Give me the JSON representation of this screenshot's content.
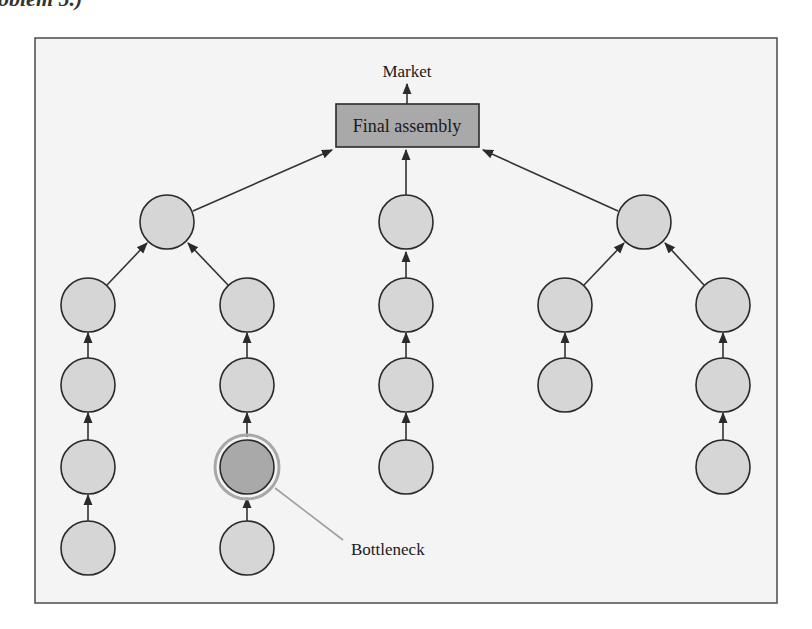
{
  "caption_fragment": "oblem 5.)",
  "diagram": {
    "title_top": "Market",
    "final_assembly_label": "Final assembly",
    "bottleneck_label": "Bottleneck",
    "colors": {
      "frame_fill": "#f4f4f4",
      "node_fill": "#d6d6d6",
      "bottleneck_fill": "#a9a9a9",
      "box_fill": "#a9a9a9",
      "stroke": "#2a2a2a",
      "leader": "#a0a0a0"
    },
    "subassemblies": [
      {
        "id": "A",
        "x": 167,
        "y": 222,
        "feeders": [
          {
            "column_x": 88,
            "nodes_y": [
              305,
              385,
              467,
              548
            ]
          },
          {
            "column_x": 247,
            "nodes_y": [
              305,
              385,
              467,
              548
            ],
            "bottleneck_index": 2
          }
        ]
      },
      {
        "id": "B",
        "x": 406,
        "y": 222,
        "feeders": [
          {
            "column_x": 406,
            "nodes_y": [
              305,
              385,
              467
            ]
          }
        ]
      },
      {
        "id": "C",
        "x": 644,
        "y": 222,
        "feeders": [
          {
            "column_x": 565,
            "nodes_y": [
              305,
              385
            ]
          },
          {
            "column_x": 723,
            "nodes_y": [
              305,
              385,
              467
            ]
          }
        ]
      }
    ]
  }
}
